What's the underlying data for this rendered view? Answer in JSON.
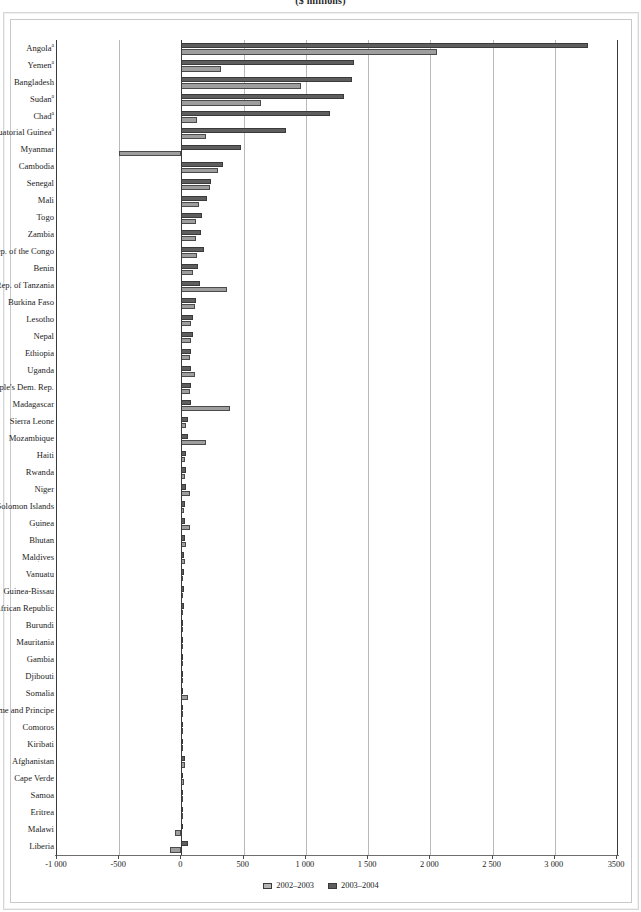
{
  "figure": {
    "title": "($ millions)",
    "legend": [
      {
        "label": "2002–2003",
        "color": "#b5b5b5"
      },
      {
        "label": "2003–2004",
        "color": "#5e5e5e"
      }
    ],
    "footnote_marker": "a"
  },
  "axis": {
    "tick_labels": [
      "-1 000",
      "-500",
      "0",
      "500",
      "1 000",
      "1 500",
      "2 000",
      "2 500",
      "3 000",
      "3500"
    ],
    "tick_values": [
      -1000,
      -500,
      0,
      500,
      1000,
      1500,
      2000,
      2500,
      3000,
      3500
    ],
    "min": -1000,
    "max": 3500,
    "step": 500
  },
  "chart_data": {
    "type": "bar",
    "orientation": "horizontal",
    "title": "($ millions)",
    "xlabel": "",
    "ylabel": "",
    "xlim": [
      -1000,
      3500
    ],
    "grid": true,
    "legend_position": "bottom-center",
    "categories": [
      "Angola",
      "Yemen",
      "Bangladesh",
      "Sudan",
      "Chad",
      "Equatorial Guinea",
      "Myanmar",
      "Cambodia",
      "Senegal",
      "Mali",
      "Togo",
      "Zambia",
      "Dem. Rep. of the Congo",
      "Benin",
      "United Rep. of Tanzania",
      "Burkina Faso",
      "Lesotho",
      "Nepal",
      "Ethiopia",
      "Uganda",
      "Lao People's Dem. Rep.",
      "Madagascar",
      "Sierra Leone",
      "Mozambique",
      "Haiti",
      "Rwanda",
      "Niger",
      "Solomon Islands",
      "Guinea",
      "Bhutan",
      "Maldives",
      "Vanuatu",
      "Guinea-Bissau",
      "Central African Republic",
      "Burundi",
      "Mauritania",
      "Gambia",
      "Djibouti",
      "Somalia",
      "Sao Tome and Principe",
      "Comoros",
      "Kiribati",
      "Afghanistan",
      "Cape Verde",
      "Samoa",
      "Eritrea",
      "Malawi",
      "Liberia"
    ],
    "categories_with_footnote": [
      "Angola",
      "Yemen",
      "Sudan",
      "Chad",
      "Equatorial Guinea"
    ],
    "series": [
      {
        "name": "2003–2004",
        "color": "#5e5e5e",
        "values": [
          3270,
          1390,
          1370,
          1310,
          1190,
          840,
          480,
          330,
          235,
          205,
          165,
          155,
          185,
          130,
          150,
          115,
          95,
          90,
          80,
          80,
          80,
          75,
          55,
          55,
          40,
          35,
          35,
          30,
          30,
          25,
          20,
          20,
          18,
          18,
          15,
          14,
          12,
          12,
          10,
          10,
          8,
          8,
          30,
          8,
          6,
          8,
          10,
          55
        ]
      },
      {
        "name": "2002–2003",
        "color": "#9e9e9e",
        "values": [
          2050,
          320,
          960,
          640,
          125,
          195,
          -500,
          290,
          230,
          140,
          115,
          120,
          125,
          90,
          365,
          105,
          75,
          75,
          65,
          110,
          70,
          390,
          40,
          195,
          30,
          25,
          65,
          22,
          72,
          35,
          25,
          16,
          12,
          10,
          10,
          8,
          6,
          6,
          50,
          6,
          4,
          4,
          25,
          20,
          4,
          4,
          -55,
          -90
        ]
      }
    ]
  }
}
